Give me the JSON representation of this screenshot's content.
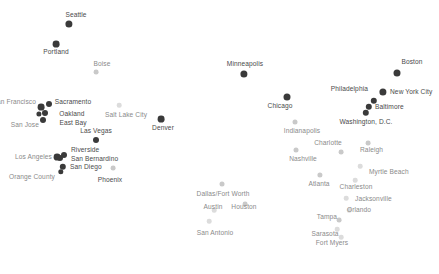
{
  "figure": {
    "title": "",
    "background_color": "#ffffff",
    "width": 439,
    "height": 274
  },
  "palette": {
    "marker_dark": "#3a3a3a",
    "marker_mid": "#8f8f8f",
    "marker_light": "#c9c9c9",
    "marker_faint": "#dcdcdc",
    "label_dark": "#4a4a4a",
    "label_mid": "#8a8a8a",
    "label_light": "#b4b4b4"
  },
  "chart_data": {
    "type": "scatter",
    "title": "",
    "xlabel": "",
    "ylabel": "",
    "grid": false,
    "legend": null,
    "xlim": [
      0,
      439
    ],
    "ylim": [
      0,
      274
    ],
    "points": [
      {
        "label": "Seattle",
        "x": 69,
        "y": 24,
        "r": 3.6,
        "tone": "dark",
        "lx": 76,
        "ly": 15,
        "anchor": "middle",
        "label_tone": "dark"
      },
      {
        "label": "Portland",
        "x": 56,
        "y": 44,
        "r": 3.4,
        "tone": "dark",
        "lx": 56,
        "ly": 52,
        "anchor": "middle",
        "label_tone": "dark"
      },
      {
        "label": "Boise",
        "x": 96,
        "y": 72,
        "r": 2.4,
        "tone": "light",
        "lx": 102,
        "ly": 64,
        "anchor": "middle",
        "label_tone": "mid"
      },
      {
        "label": "Minneapolis",
        "x": 244,
        "y": 74,
        "r": 3.6,
        "tone": "dark",
        "lx": 245,
        "ly": 64,
        "anchor": "middle",
        "label_tone": "dark"
      },
      {
        "label": "Boston",
        "x": 397,
        "y": 73,
        "r": 3.5,
        "tone": "dark",
        "lx": 412,
        "ly": 62,
        "anchor": "middle",
        "label_tone": "dark"
      },
      {
        "label": "Chicago",
        "x": 287,
        "y": 97,
        "r": 3.5,
        "tone": "dark",
        "lx": 280,
        "ly": 106,
        "anchor": "middle",
        "label_tone": "dark"
      },
      {
        "label": "New York City",
        "x": 383,
        "y": 92,
        "r": 3.6,
        "tone": "dark",
        "lx": 390,
        "ly": 92,
        "anchor": "start",
        "label_tone": "dark"
      },
      {
        "label": "Philadelphia",
        "x": 374,
        "y": 101,
        "r": 3.2,
        "tone": "dark",
        "lx": 368,
        "ly": 89,
        "anchor": "end",
        "label_tone": "dark"
      },
      {
        "label": "Baltimore",
        "x": 369,
        "y": 107,
        "r": 3.2,
        "tone": "dark",
        "lx": 375,
        "ly": 107,
        "anchor": "start",
        "label_tone": "dark"
      },
      {
        "label": "Washington, D.C.",
        "x": 366,
        "y": 113,
        "r": 3.2,
        "tone": "dark",
        "lx": 366,
        "ly": 122,
        "anchor": "middle",
        "label_tone": "dark"
      },
      {
        "label": "San Francisco",
        "x": 41,
        "y": 107,
        "r": 3.4,
        "tone": "dark",
        "lx": 36,
        "ly": 102,
        "anchor": "end",
        "label_tone": "mid"
      },
      {
        "label": "Sacramento",
        "x": 49,
        "y": 104,
        "r": 3.0,
        "tone": "dark",
        "lx": 73,
        "ly": 102,
        "anchor": "middle",
        "label_tone": "dark"
      },
      {
        "label": "Oakland",
        "x": 45,
        "y": 113,
        "r": 3.0,
        "tone": "dark",
        "lx": 72,
        "ly": 114,
        "anchor": "middle",
        "label_tone": "dark"
      },
      {
        "label": "East Bay",
        "x": 39,
        "y": 114,
        "r": 2.6,
        "tone": "dark",
        "lx": 73,
        "ly": 123,
        "anchor": "middle",
        "label_tone": "dark"
      },
      {
        "label": "San Jose",
        "x": 43,
        "y": 120,
        "r": 3.0,
        "tone": "dark",
        "lx": 39,
        "ly": 125,
        "anchor": "end",
        "label_tone": "mid"
      },
      {
        "label": "Salt Lake City",
        "x": 119,
        "y": 105,
        "r": 2.3,
        "tone": "faint",
        "lx": 126,
        "ly": 115,
        "anchor": "middle",
        "label_tone": "mid"
      },
      {
        "label": "Denver",
        "x": 161,
        "y": 119,
        "r": 3.4,
        "tone": "dark",
        "lx": 163,
        "ly": 128,
        "anchor": "middle",
        "label_tone": "dark"
      },
      {
        "label": "Las Vegas",
        "x": 96,
        "y": 140,
        "r": 3.0,
        "tone": "dark",
        "lx": 96,
        "ly": 131,
        "anchor": "middle",
        "label_tone": "dark"
      },
      {
        "label": "Indianapolis",
        "x": 295,
        "y": 122,
        "r": 2.5,
        "tone": "light",
        "lx": 302,
        "ly": 131,
        "anchor": "middle",
        "label_tone": "mid"
      },
      {
        "label": "Riverside",
        "x": 64,
        "y": 155,
        "r": 3.0,
        "tone": "dark",
        "lx": 71,
        "ly": 150,
        "anchor": "start",
        "label_tone": "dark"
      },
      {
        "label": "San Bernardino",
        "x": 60,
        "y": 158,
        "r": 3.0,
        "tone": "dark",
        "lx": 71,
        "ly": 159,
        "anchor": "start",
        "label_tone": "dark"
      },
      {
        "label": "Los Angeles",
        "x": 57,
        "y": 157,
        "r": 3.4,
        "tone": "dark",
        "lx": 52,
        "ly": 157,
        "anchor": "end",
        "label_tone": "mid"
      },
      {
        "label": "San Diego",
        "x": 63,
        "y": 167,
        "r": 3.2,
        "tone": "dark",
        "lx": 70,
        "ly": 167,
        "anchor": "start",
        "label_tone": "dark"
      },
      {
        "label": "Orange County",
        "x": 61,
        "y": 172,
        "r": 2.7,
        "tone": "dark",
        "lx": 55,
        "ly": 177,
        "anchor": "end",
        "label_tone": "mid"
      },
      {
        "label": "Phoenix",
        "x": 113,
        "y": 168,
        "r": 2.4,
        "tone": "light",
        "lx": 110,
        "ly": 180,
        "anchor": "middle",
        "label_tone": "dark"
      },
      {
        "label": "Nashville",
        "x": 296,
        "y": 150,
        "r": 2.5,
        "tone": "light",
        "lx": 303,
        "ly": 159,
        "anchor": "middle",
        "label_tone": "mid"
      },
      {
        "label": "Charlotte",
        "x": 341,
        "y": 152,
        "r": 2.4,
        "tone": "light",
        "lx": 328,
        "ly": 143,
        "anchor": "middle",
        "label_tone": "mid"
      },
      {
        "label": "Raleigh",
        "x": 368,
        "y": 143,
        "r": 2.4,
        "tone": "light",
        "lx": 360,
        "ly": 150,
        "anchor": "start",
        "label_tone": "mid"
      },
      {
        "label": "Atlanta",
        "x": 320,
        "y": 175,
        "r": 2.6,
        "tone": "light",
        "lx": 319,
        "ly": 184,
        "anchor": "middle",
        "label_tone": "mid"
      },
      {
        "label": "Myrtle Beach",
        "x": 360,
        "y": 166,
        "r": 2.3,
        "tone": "faint",
        "lx": 369,
        "ly": 172,
        "anchor": "start",
        "label_tone": "mid"
      },
      {
        "label": "Charleston",
        "x": 355,
        "y": 180,
        "r": 2.3,
        "tone": "faint",
        "lx": 356,
        "ly": 187,
        "anchor": "middle",
        "label_tone": "mid"
      },
      {
        "label": "Dallas/Fort Worth",
        "x": 222,
        "y": 184,
        "r": 2.5,
        "tone": "light",
        "lx": 223,
        "ly": 194,
        "anchor": "middle",
        "label_tone": "mid"
      },
      {
        "label": "Houston",
        "x": 245,
        "y": 204,
        "r": 2.4,
        "tone": "light",
        "lx": 244,
        "ly": 207,
        "anchor": "middle",
        "label_tone": "mid"
      },
      {
        "label": "Austin",
        "x": 214,
        "y": 210,
        "r": 2.3,
        "tone": "faint",
        "lx": 213,
        "ly": 207,
        "anchor": "middle",
        "label_tone": "mid"
      },
      {
        "label": "San Antonio",
        "x": 209,
        "y": 221,
        "r": 2.3,
        "tone": "faint",
        "lx": 215,
        "ly": 233,
        "anchor": "middle",
        "label_tone": "mid"
      },
      {
        "label": "Jacksonville",
        "x": 346,
        "y": 198,
        "r": 2.3,
        "tone": "faint",
        "lx": 355,
        "ly": 199,
        "anchor": "start",
        "label_tone": "mid"
      },
      {
        "label": "Orlando",
        "x": 349,
        "y": 210,
        "r": 2.3,
        "tone": "faint",
        "lx": 359,
        "ly": 210,
        "anchor": "middle",
        "label_tone": "mid"
      },
      {
        "label": "Tampa",
        "x": 339,
        "y": 220,
        "r": 2.4,
        "tone": "light",
        "lx": 327,
        "ly": 217,
        "anchor": "middle",
        "label_tone": "mid"
      },
      {
        "label": "Sarasota",
        "x": 337,
        "y": 229,
        "r": 2.3,
        "tone": "faint",
        "lx": 325,
        "ly": 234,
        "anchor": "middle",
        "label_tone": "mid"
      },
      {
        "label": "Fort Myers",
        "x": 341,
        "y": 237,
        "r": 2.3,
        "tone": "faint",
        "lx": 332,
        "ly": 243,
        "anchor": "middle",
        "label_tone": "mid"
      }
    ]
  }
}
